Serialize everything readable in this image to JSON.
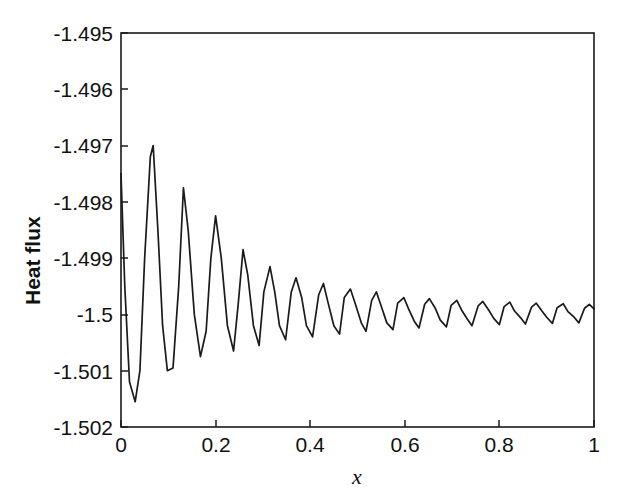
{
  "chart_data": {
    "type": "line",
    "title": "",
    "subtitle": "",
    "xlabel": "x",
    "ylabel": "Heat flux",
    "xlim": [
      0,
      1
    ],
    "ylim": [
      -1.502,
      -1.495
    ],
    "xticks": [
      0,
      0.2,
      0.4,
      0.6,
      0.8,
      1
    ],
    "xticklabels": [
      "0",
      "0.2",
      "0.4",
      "0.6",
      "0.8",
      "1"
    ],
    "yticks": [
      -1.502,
      -1.501,
      -1.5,
      -1.499,
      -1.498,
      -1.497,
      -1.496,
      -1.495
    ],
    "yticklabels": [
      "-1.502",
      "-1.501",
      "-1.5",
      "-1.499",
      "-1.498",
      "-1.497",
      "-1.496",
      "-1.495"
    ],
    "grid": false,
    "legend": null,
    "line_color": "#1a1a1a",
    "series": [
      {
        "name": "Heat flux",
        "description": "Damped oscillation about -1.5 with period approximately 0.068 in x; amplitude decays from about 0.003 near x=0 to about 0.0002 near x=1",
        "baseline": -1.5,
        "period": 0.0675,
        "x": [
          0.0,
          0.008,
          0.018,
          0.03,
          0.04,
          0.05,
          0.062,
          0.068,
          0.078,
          0.088,
          0.098,
          0.11,
          0.122,
          0.132,
          0.142,
          0.155,
          0.168,
          0.18,
          0.19,
          0.2,
          0.212,
          0.225,
          0.238,
          0.248,
          0.258,
          0.268,
          0.28,
          0.292,
          0.302,
          0.315,
          0.325,
          0.335,
          0.348,
          0.36,
          0.37,
          0.382,
          0.392,
          0.405,
          0.418,
          0.428,
          0.438,
          0.45,
          0.462,
          0.472,
          0.485,
          0.495,
          0.508,
          0.518,
          0.53,
          0.54,
          0.552,
          0.562,
          0.575,
          0.585,
          0.598,
          0.608,
          0.62,
          0.63,
          0.642,
          0.652,
          0.665,
          0.675,
          0.688,
          0.698,
          0.71,
          0.72,
          0.732,
          0.742,
          0.755,
          0.765,
          0.778,
          0.788,
          0.8,
          0.81,
          0.822,
          0.832,
          0.845,
          0.855,
          0.868,
          0.878,
          0.89,
          0.9,
          0.912,
          0.922,
          0.935,
          0.945,
          0.958,
          0.968,
          0.98,
          0.99,
          1.0
        ],
        "y": [
          -1.4975,
          -1.4995,
          -1.5012,
          -1.50155,
          -1.501,
          -1.499,
          -1.4972,
          -1.497,
          -1.4985,
          -1.5002,
          -1.501,
          -1.50095,
          -1.4995,
          -1.49775,
          -1.4985,
          -1.5,
          -1.50075,
          -1.5003,
          -1.499,
          -1.49825,
          -1.499,
          -1.5002,
          -1.50065,
          -1.4998,
          -1.49885,
          -1.4993,
          -1.5002,
          -1.50055,
          -1.4996,
          -1.49915,
          -1.4996,
          -1.5002,
          -1.50045,
          -1.4996,
          -1.49935,
          -1.4997,
          -1.5002,
          -1.5004,
          -1.49965,
          -1.49945,
          -1.4998,
          -1.5002,
          -1.50035,
          -1.4997,
          -1.49955,
          -1.4998,
          -1.50015,
          -1.5003,
          -1.49975,
          -1.4996,
          -1.4999,
          -1.50015,
          -1.50027,
          -1.4998,
          -1.4997,
          -1.4999,
          -1.50012,
          -1.50024,
          -1.49982,
          -1.49972,
          -1.4999,
          -1.5001,
          -1.50022,
          -1.49984,
          -1.49975,
          -1.49992,
          -1.50008,
          -1.5002,
          -1.49985,
          -1.49977,
          -1.49993,
          -1.50007,
          -1.50018,
          -1.49986,
          -1.49978,
          -1.49994,
          -1.50006,
          -1.50017,
          -1.49987,
          -1.4998,
          -1.49994,
          -1.50005,
          -1.50016,
          -1.49988,
          -1.49981,
          -1.49995,
          -1.50005,
          -1.50015,
          -1.49989,
          -1.49982,
          -1.4999
        ]
      }
    ]
  },
  "axes": {
    "ylabel": "Heat flux",
    "xlabel": "x"
  }
}
